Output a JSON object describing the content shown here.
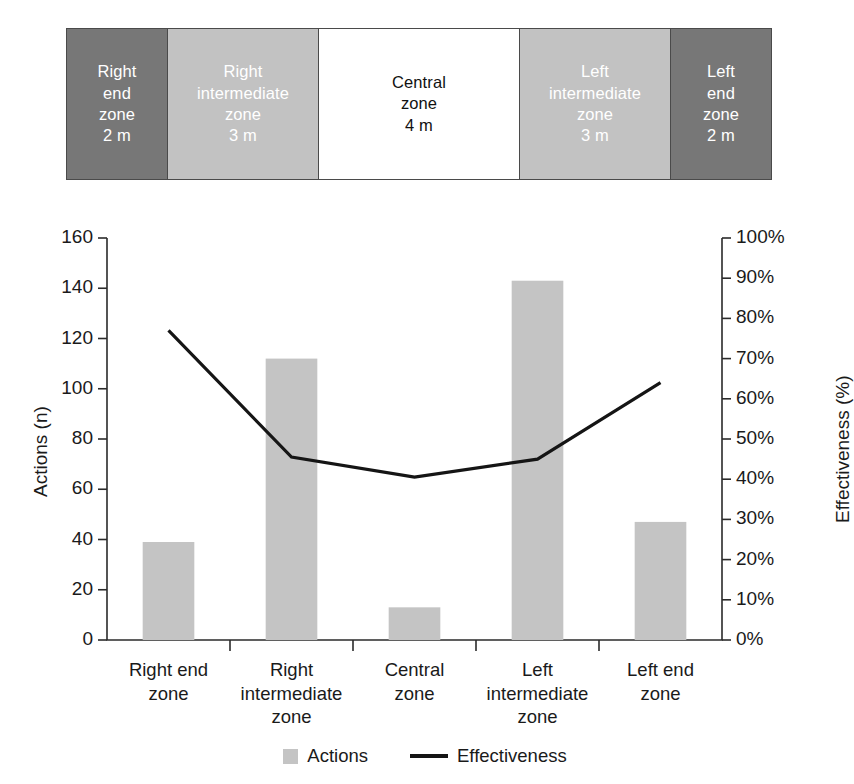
{
  "zone_strip": {
    "name": "zone-diagram",
    "zones": [
      {
        "id": "right-end-zone",
        "label": "Right\nend\nzone\n2 m",
        "shade": "dark",
        "width_m": 2,
        "color": "#777777"
      },
      {
        "id": "right-intermediate-zone",
        "label": "Right\nintermediate\nzone\n3 m",
        "shade": "mid",
        "width_m": 3,
        "color": "#c2c2c2"
      },
      {
        "id": "central-zone",
        "label": "Central\nzone\n4 m",
        "shade": "light",
        "width_m": 4,
        "color": "#ffffff"
      },
      {
        "id": "left-intermediate-zone",
        "label": "Left\nintermediate\nzone\n3 m",
        "shade": "mid",
        "width_m": 3,
        "color": "#c2c2c2"
      },
      {
        "id": "left-end-zone",
        "label": "Left\nend\nzone\n2 m",
        "shade": "dark",
        "width_m": 2,
        "color": "#777777"
      }
    ]
  },
  "chart_data": {
    "type": "bar",
    "title": "",
    "categories": [
      "Right end\nzone",
      "Right\nintermediate\nzone",
      "Central\nzone",
      "Left\nintermediate\nzone",
      "Left end\nzone"
    ],
    "series": [
      {
        "name": "Actions",
        "type": "bar",
        "axis": "left",
        "values": [
          39,
          112,
          13,
          143,
          47
        ],
        "color": "#c4c4c4"
      },
      {
        "name": "Effectiveness",
        "type": "line",
        "axis": "right",
        "values": [
          77,
          45.5,
          40.5,
          45,
          64
        ],
        "color": "#151515"
      }
    ],
    "xlabel": "",
    "ylabel": "Actions (n)",
    "y2label": "Effectiveness (%)",
    "ylim": [
      0,
      160
    ],
    "y2lim": [
      0,
      100
    ],
    "yticks": [
      0,
      20,
      40,
      60,
      80,
      100,
      120,
      140,
      160
    ],
    "ytick_labels": [
      "0",
      "20",
      "40",
      "60",
      "80",
      "100",
      "120",
      "140",
      "160"
    ],
    "y2ticks": [
      0,
      10,
      20,
      30,
      40,
      50,
      60,
      70,
      80,
      90,
      100
    ],
    "y2tick_labels": [
      "0%",
      "10%",
      "20%",
      "30%",
      "40%",
      "50%",
      "60%",
      "70%",
      "80%",
      "90%",
      "100%"
    ],
    "grid": false,
    "legend_position": "bottom",
    "legend": [
      "Actions",
      "Effectiveness"
    ]
  }
}
